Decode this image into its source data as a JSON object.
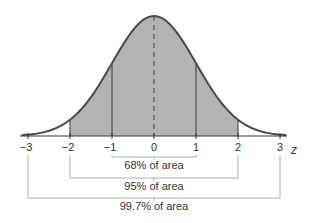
{
  "chart_data": {
    "type": "area",
    "title": "",
    "xlabel": "z",
    "ylabel": "",
    "distribution": "standard normal",
    "mean": 0,
    "sd": 1,
    "xlim": [
      -3,
      3
    ],
    "x_ticks": [
      -3,
      -2,
      -1,
      0,
      1,
      2,
      3
    ],
    "x_tick_labels": [
      "−3",
      "−2",
      "−1",
      "0",
      "1",
      "2",
      "3"
    ],
    "shaded_region": [
      -2,
      2
    ],
    "vertical_lines": [
      -2,
      -1,
      1,
      2
    ],
    "dashed_center_line": 0,
    "brackets": [
      {
        "from": -1,
        "to": 1,
        "label": "68% of area",
        "percent": 68
      },
      {
        "from": -2,
        "to": 2,
        "label": "95% of area",
        "percent": 95
      },
      {
        "from": -3,
        "to": 3,
        "label": "99.7% of area",
        "percent": 99.7
      }
    ],
    "grid": false,
    "legend": null
  },
  "colors": {
    "curve": "#4a4a4a",
    "fill": "#b3b3b3",
    "axis": "#333333",
    "bracket": "#b0b0b0",
    "lines": "#3a3a3a"
  }
}
